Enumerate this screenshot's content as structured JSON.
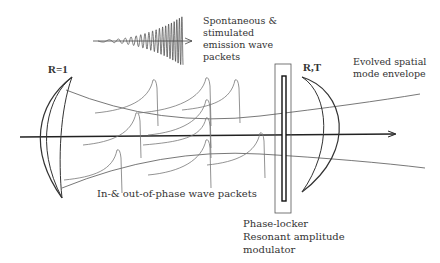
{
  "diagram": {
    "colors": {
      "ink": "#333333",
      "faint": "#888888",
      "axis": "#222222"
    },
    "labels": {
      "emission": [
        "Spontaneous &",
        "stimulated",
        "emission wave",
        "packets"
      ],
      "left_mirror": "R=1",
      "right_mirror": "R,T",
      "envelope": [
        "Evolved spatial",
        "mode envelope"
      ],
      "packets": "In-& out-of-phase wave packets",
      "modulator": [
        "Phase-locker",
        "Resonant amplitude",
        "modulator"
      ]
    },
    "components": [
      {
        "name": "left-mirror",
        "reflectivity": "R=1"
      },
      {
        "name": "right-mirror",
        "reflectivity": "R,T"
      },
      {
        "name": "phase-locker",
        "type": "Resonant amplitude modulator"
      },
      {
        "name": "optical-axis"
      },
      {
        "name": "mode-envelope"
      },
      {
        "name": "wave-packets"
      }
    ]
  }
}
